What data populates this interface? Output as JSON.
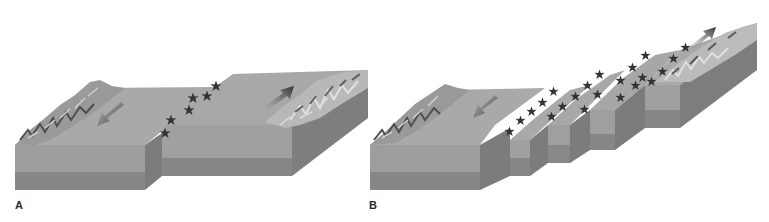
{
  "figure": {
    "panels": [
      {
        "label": "A",
        "description": "Two crustal blocks offset along a single transform fault; arrows show opposite relative motion",
        "arrows": [
          "down-left arrow on left block",
          "up-right arrow on right block"
        ],
        "earthquake_markers": 6
      },
      {
        "label": "B",
        "description": "Series of stepped blocks offset along multiple parallel transform faults; arrows show opposite relative motion",
        "arrows": [
          "down-left arrow on left block",
          "up-right arrow on right block"
        ],
        "earthquake_markers": 22
      }
    ]
  },
  "colors": {
    "top_surface": "#a9a9a9",
    "front_upper": "#9c9c9c",
    "front_lower": "#858585",
    "side_face": "#7d7d7d",
    "arrow": "#3a3a3a",
    "star": "#333333",
    "mountains_dark": "#5a5a5a",
    "mountains_light": "#d6d6d6"
  }
}
